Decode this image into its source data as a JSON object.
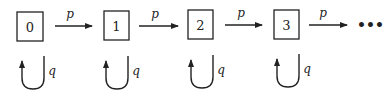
{
  "diagram": {
    "type": "markov-chain",
    "states": [
      {
        "label": "0",
        "x": 17,
        "y": 12,
        "w": 26,
        "h": 29
      },
      {
        "label": "1",
        "x": 104,
        "y": 11,
        "w": 25,
        "h": 29
      },
      {
        "label": "2",
        "x": 188,
        "y": 10,
        "w": 25,
        "h": 29
      },
      {
        "label": "3",
        "x": 274,
        "y": 10,
        "w": 25,
        "h": 29
      }
    ],
    "transitions": [
      {
        "from": "0",
        "to": "1",
        "label": "p"
      },
      {
        "from": "1",
        "to": "2",
        "label": "p"
      },
      {
        "from": "2",
        "to": "3",
        "label": "p"
      },
      {
        "from": "3",
        "to": "...",
        "label": "p"
      }
    ],
    "self_loops": [
      {
        "state": "0",
        "label": "q"
      },
      {
        "state": "1",
        "label": "q"
      },
      {
        "state": "2",
        "label": "q"
      },
      {
        "state": "3",
        "label": "q"
      }
    ],
    "continuation": "•••",
    "colors": {
      "stroke": "#222222",
      "background": "#ffffff"
    }
  }
}
